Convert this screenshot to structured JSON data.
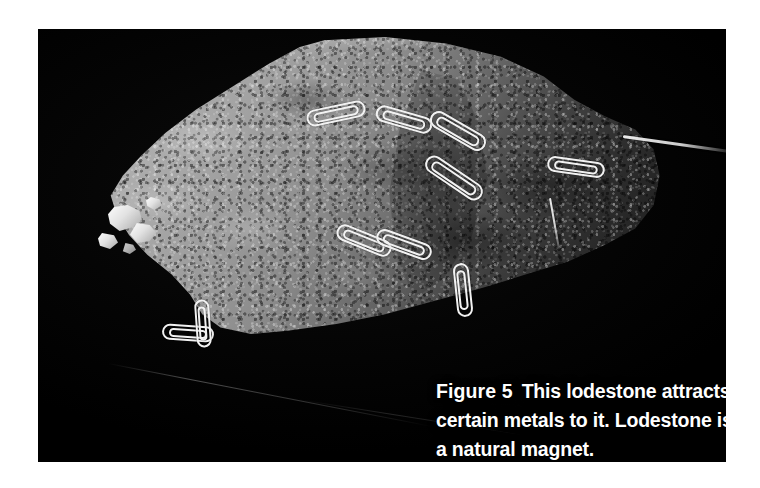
{
  "figure": {
    "label": "Figure 5",
    "caption": "This lodestone attracts certain metals to it. Lodestone is a natural magnet.",
    "subject": "lodestone",
    "alt": "A dark grey lodestone rock on a black background with many steel paper clips and a needle clinging to its surface.",
    "colors": {
      "page_background": "#ffffff",
      "photo_background": "#000000",
      "caption_text": "#ffffff",
      "rock_highlight": "#b9b9b9",
      "rock_midtone": "#8a8a8a",
      "rock_shadow": "#1b1b1b",
      "metal_clip": "#f2f2f2"
    }
  },
  "objects": {
    "rock_name": "lodestone",
    "attached_items": [
      {
        "name": "paperclip-1",
        "x": 268,
        "y": 76,
        "angle": -12,
        "length": 60,
        "width": 17
      },
      {
        "name": "paperclip-2",
        "x": 337,
        "y": 82,
        "angle": 16,
        "length": 58,
        "width": 17
      },
      {
        "name": "paperclip-3",
        "x": 389,
        "y": 93,
        "angle": 30,
        "length": 62,
        "width": 18
      },
      {
        "name": "paperclip-4",
        "x": 383,
        "y": 140,
        "angle": 34,
        "length": 66,
        "width": 18
      },
      {
        "name": "paperclip-5",
        "x": 297,
        "y": 203,
        "angle": 22,
        "length": 58,
        "width": 17
      },
      {
        "name": "paperclip-6",
        "x": 337,
        "y": 207,
        "angle": 20,
        "length": 58,
        "width": 17
      },
      {
        "name": "paperclip-7",
        "x": 509,
        "y": 130,
        "angle": 8,
        "length": 58,
        "width": 16
      },
      {
        "name": "paperclip-8",
        "x": 398,
        "y": 253,
        "angle": 84,
        "length": 54,
        "width": 16
      },
      {
        "name": "paperclip-9",
        "x": 124,
        "y": 296,
        "angle": 4,
        "length": 52,
        "width": 16
      },
      {
        "name": "paperclip-10",
        "x": 141,
        "y": 287,
        "angle": 86,
        "length": 48,
        "width": 15
      },
      {
        "name": "needle-long",
        "x": 585,
        "y": 106,
        "angle": 8,
        "length": 108,
        "width": 3
      },
      {
        "name": "pin-short",
        "x": 512,
        "y": 168,
        "angle": 80,
        "length": 52,
        "width": 2
      }
    ]
  }
}
